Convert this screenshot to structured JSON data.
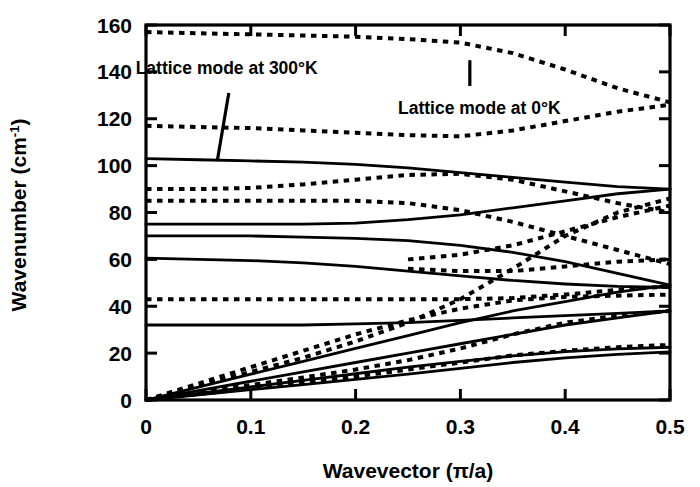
{
  "chart_data": {
    "type": "line",
    "title": "",
    "xlabel": "Wavevector (π/a)",
    "ylabel": "Wavenumber (cm⁻¹)",
    "xlim": [
      0,
      0.5
    ],
    "ylim": [
      0,
      160
    ],
    "xticks": [
      0,
      0.1,
      0.2,
      0.3,
      0.4,
      0.5
    ],
    "xticklabels": [
      "0",
      "0.1",
      "0.2",
      "0.3",
      "0.4",
      "0.5"
    ],
    "yticks": [
      0,
      20,
      40,
      60,
      80,
      100,
      120,
      140,
      160
    ],
    "yticklabels": [
      "0",
      "20",
      "40",
      "60",
      "80",
      "100",
      "120",
      "140",
      "160"
    ],
    "grid": false,
    "legend": "none",
    "annotations": [
      {
        "name": "lattice-mode-300K",
        "text": "Lattice mode at 300°K",
        "text_x": 0.077,
        "text_y": 139,
        "leader": [
          [
            0.079,
            131
          ],
          [
            0.068,
            102
          ]
        ]
      },
      {
        "name": "lattice-mode-0K",
        "text": "Lattice mode at 0°K",
        "text_x": 0.318,
        "text_y": 122,
        "leader": [
          [
            0.309,
            145
          ],
          [
            0.309,
            134
          ]
        ]
      }
    ],
    "series": [
      {
        "name": "solid-branch-1",
        "style": "solid",
        "color": "#000000",
        "points": [
          [
            0,
            103
          ],
          [
            0.05,
            102.5
          ],
          [
            0.1,
            102
          ],
          [
            0.15,
            101.5
          ],
          [
            0.2,
            100.5
          ],
          [
            0.25,
            99
          ],
          [
            0.3,
            97
          ],
          [
            0.35,
            95
          ],
          [
            0.4,
            93
          ],
          [
            0.45,
            91
          ],
          [
            0.5,
            90
          ]
        ]
      },
      {
        "name": "solid-branch-2",
        "style": "solid",
        "color": "#000000",
        "points": [
          [
            0,
            75
          ],
          [
            0.05,
            75
          ],
          [
            0.1,
            75
          ],
          [
            0.15,
            75
          ],
          [
            0.2,
            75.5
          ],
          [
            0.25,
            77
          ],
          [
            0.3,
            79
          ],
          [
            0.35,
            82
          ],
          [
            0.4,
            85
          ],
          [
            0.45,
            88
          ],
          [
            0.5,
            90
          ]
        ]
      },
      {
        "name": "solid-branch-3",
        "style": "solid",
        "color": "#000000",
        "points": [
          [
            0,
            70
          ],
          [
            0.05,
            70
          ],
          [
            0.1,
            70
          ],
          [
            0.15,
            69.5
          ],
          [
            0.2,
            69
          ],
          [
            0.25,
            68
          ],
          [
            0.3,
            66
          ],
          [
            0.35,
            63
          ],
          [
            0.4,
            59
          ],
          [
            0.45,
            54
          ],
          [
            0.5,
            49
          ]
        ]
      },
      {
        "name": "solid-branch-4",
        "style": "solid",
        "color": "#000000",
        "points": [
          [
            0,
            60.5
          ],
          [
            0.05,
            60
          ],
          [
            0.1,
            59.5
          ],
          [
            0.15,
            58.5
          ],
          [
            0.2,
            57
          ],
          [
            0.25,
            55
          ],
          [
            0.3,
            53
          ],
          [
            0.35,
            51
          ],
          [
            0.4,
            49.5
          ],
          [
            0.45,
            48.5
          ],
          [
            0.5,
            48
          ]
        ]
      },
      {
        "name": "solid-branch-5",
        "style": "solid",
        "color": "#000000",
        "points": [
          [
            0,
            32
          ],
          [
            0.05,
            32
          ],
          [
            0.1,
            32
          ],
          [
            0.15,
            32
          ],
          [
            0.2,
            32.5
          ],
          [
            0.25,
            33
          ],
          [
            0.3,
            34
          ],
          [
            0.35,
            35
          ],
          [
            0.4,
            36
          ],
          [
            0.45,
            37
          ],
          [
            0.5,
            38
          ]
        ]
      },
      {
        "name": "solid-acoustic-1",
        "style": "solid",
        "color": "#000000",
        "points": [
          [
            0,
            0
          ],
          [
            0.05,
            5.5
          ],
          [
            0.1,
            11
          ],
          [
            0.15,
            16.5
          ],
          [
            0.2,
            22
          ],
          [
            0.25,
            27.5
          ],
          [
            0.3,
            33
          ],
          [
            0.35,
            38
          ],
          [
            0.4,
            42
          ],
          [
            0.45,
            46
          ],
          [
            0.5,
            49
          ]
        ]
      },
      {
        "name": "solid-acoustic-2",
        "style": "solid",
        "color": "#000000",
        "points": [
          [
            0,
            0
          ],
          [
            0.05,
            4
          ],
          [
            0.1,
            8
          ],
          [
            0.15,
            12
          ],
          [
            0.2,
            16
          ],
          [
            0.25,
            20
          ],
          [
            0.3,
            24
          ],
          [
            0.35,
            28
          ],
          [
            0.4,
            32
          ],
          [
            0.45,
            35
          ],
          [
            0.5,
            38
          ]
        ]
      },
      {
        "name": "solid-acoustic-3",
        "style": "solid",
        "color": "#000000",
        "points": [
          [
            0,
            0
          ],
          [
            0.05,
            2.8
          ],
          [
            0.1,
            5.6
          ],
          [
            0.15,
            8.4
          ],
          [
            0.2,
            11.2
          ],
          [
            0.25,
            14
          ],
          [
            0.3,
            16.5
          ],
          [
            0.35,
            18.8
          ],
          [
            0.4,
            20.6
          ],
          [
            0.45,
            21.8
          ],
          [
            0.5,
            22.5
          ]
        ]
      },
      {
        "name": "solid-acoustic-4",
        "style": "solid",
        "color": "#000000",
        "points": [
          [
            0,
            0
          ],
          [
            0.05,
            2.2
          ],
          [
            0.1,
            4.4
          ],
          [
            0.15,
            6.6
          ],
          [
            0.2,
            8.8
          ],
          [
            0.25,
            11
          ],
          [
            0.3,
            13.5
          ],
          [
            0.35,
            16
          ],
          [
            0.4,
            18
          ],
          [
            0.45,
            19.5
          ],
          [
            0.5,
            20.5
          ]
        ]
      },
      {
        "name": "dashed-branch-1",
        "style": "dashed",
        "color": "#000000",
        "points": [
          [
            0,
            157
          ],
          [
            0.05,
            156.5
          ],
          [
            0.1,
            156
          ],
          [
            0.15,
            155.5
          ],
          [
            0.2,
            155
          ],
          [
            0.25,
            154
          ],
          [
            0.3,
            152.5
          ],
          [
            0.35,
            148
          ],
          [
            0.4,
            141
          ],
          [
            0.45,
            133
          ],
          [
            0.5,
            127
          ]
        ]
      },
      {
        "name": "dashed-branch-2",
        "style": "dashed",
        "color": "#000000",
        "points": [
          [
            0,
            117
          ],
          [
            0.05,
            116.5
          ],
          [
            0.1,
            116
          ],
          [
            0.15,
            115
          ],
          [
            0.2,
            114
          ],
          [
            0.25,
            113
          ],
          [
            0.3,
            112.5
          ],
          [
            0.35,
            115
          ],
          [
            0.4,
            119
          ],
          [
            0.45,
            123
          ],
          [
            0.5,
            126
          ]
        ]
      },
      {
        "name": "dashed-branch-3",
        "style": "dashed",
        "color": "#000000",
        "points": [
          [
            0,
            90
          ],
          [
            0.05,
            90
          ],
          [
            0.1,
            90.5
          ],
          [
            0.15,
            92
          ],
          [
            0.2,
            94
          ],
          [
            0.25,
            96
          ],
          [
            0.3,
            96.5
          ],
          [
            0.35,
            94
          ],
          [
            0.4,
            89
          ],
          [
            0.45,
            84
          ],
          [
            0.5,
            80
          ]
        ]
      },
      {
        "name": "dashed-branch-4",
        "style": "dashed",
        "color": "#000000",
        "points": [
          [
            0,
            85
          ],
          [
            0.05,
            85
          ],
          [
            0.1,
            85
          ],
          [
            0.15,
            85
          ],
          [
            0.2,
            85
          ],
          [
            0.25,
            84
          ],
          [
            0.3,
            81
          ],
          [
            0.35,
            76
          ],
          [
            0.4,
            70
          ],
          [
            0.45,
            64
          ],
          [
            0.5,
            58
          ]
        ]
      },
      {
        "name": "dashed-branch-5",
        "style": "dashed",
        "color": "#000000",
        "points": [
          [
            0,
            43
          ],
          [
            0.05,
            43
          ],
          [
            0.1,
            43
          ],
          [
            0.15,
            43
          ],
          [
            0.2,
            43
          ],
          [
            0.25,
            43
          ],
          [
            0.3,
            43
          ],
          [
            0.35,
            43.5
          ],
          [
            0.4,
            45
          ],
          [
            0.45,
            47
          ],
          [
            0.5,
            48.5
          ]
        ]
      },
      {
        "name": "dashed-rising-1",
        "style": "dashed",
        "color": "#000000",
        "points": [
          [
            0,
            0
          ],
          [
            0.05,
            7
          ],
          [
            0.1,
            14
          ],
          [
            0.15,
            21
          ],
          [
            0.2,
            28
          ],
          [
            0.25,
            34
          ],
          [
            0.3,
            39
          ],
          [
            0.35,
            42.5
          ],
          [
            0.4,
            44
          ],
          [
            0.45,
            44.5
          ],
          [
            0.5,
            45
          ]
        ]
      },
      {
        "name": "dashed-rising-2",
        "style": "dashed",
        "color": "#000000",
        "points": [
          [
            0,
            0
          ],
          [
            0.05,
            6
          ],
          [
            0.1,
            12
          ],
          [
            0.15,
            18
          ],
          [
            0.2,
            25
          ],
          [
            0.25,
            33
          ],
          [
            0.3,
            43
          ],
          [
            0.35,
            56
          ],
          [
            0.4,
            70
          ],
          [
            0.45,
            80
          ],
          [
            0.5,
            86
          ]
        ]
      },
      {
        "name": "dashed-rising-3",
        "style": "dashed",
        "color": "#000000",
        "points": [
          [
            0,
            0
          ],
          [
            0.05,
            3.2
          ],
          [
            0.1,
            6.4
          ],
          [
            0.15,
            9.6
          ],
          [
            0.2,
            13
          ],
          [
            0.25,
            17
          ],
          [
            0.3,
            22
          ],
          [
            0.35,
            28
          ],
          [
            0.4,
            33
          ],
          [
            0.45,
            36
          ],
          [
            0.5,
            38
          ]
        ]
      },
      {
        "name": "dashed-rising-4",
        "style": "dashed",
        "color": "#000000",
        "points": [
          [
            0,
            0
          ],
          [
            0.05,
            2.5
          ],
          [
            0.1,
            5
          ],
          [
            0.15,
            7.5
          ],
          [
            0.2,
            10
          ],
          [
            0.25,
            13
          ],
          [
            0.3,
            16
          ],
          [
            0.35,
            19
          ],
          [
            0.4,
            21
          ],
          [
            0.45,
            22.5
          ],
          [
            0.5,
            23.5
          ]
        ]
      },
      {
        "name": "dashed-mid-upper",
        "style": "dashed",
        "color": "#000000",
        "points": [
          [
            0.25,
            60
          ],
          [
            0.3,
            62
          ],
          [
            0.35,
            66
          ],
          [
            0.4,
            72
          ],
          [
            0.45,
            78
          ],
          [
            0.5,
            83
          ]
        ]
      },
      {
        "name": "dashed-mid-lower",
        "style": "dashed",
        "color": "#000000",
        "points": [
          [
            0.25,
            56
          ],
          [
            0.3,
            55
          ],
          [
            0.35,
            55
          ],
          [
            0.4,
            57
          ],
          [
            0.45,
            59
          ],
          [
            0.5,
            60
          ]
        ]
      }
    ]
  }
}
